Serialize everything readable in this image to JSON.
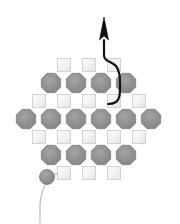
{
  "figure": {
    "width": 180,
    "height": 223,
    "background_color": "#ffffff"
  },
  "colors": {
    "octagon_fill": "#8d8d8d",
    "octagon_fill_light": "#a2a2a2",
    "octagon_stroke": "#7a7a7a",
    "square_fill": "#efefef",
    "square_fill_light": "#fbfbfb",
    "square_stroke": "#cfcfcf",
    "wire_black": "#111111",
    "wire_gray": "#c3c3c3",
    "circle_fill": "#8d8d8d",
    "circle_stroke": "#7a7a7a"
  },
  "geometry": {
    "octagon_radius": 10.5,
    "square_size": 13,
    "column_pitch": 25,
    "row_pitch": 17.5
  },
  "lattice": {
    "rows": [
      {
        "index": 0,
        "type": "square",
        "y": 65,
        "count": 3,
        "items": [
          {
            "name": "site-0-0",
            "x": 64
          },
          {
            "name": "site-0-1",
            "x": 89
          },
          {
            "name": "site-0-2",
            "x": 114
          }
        ]
      },
      {
        "index": 1,
        "type": "octagon",
        "y": 83,
        "count": 4,
        "items": [
          {
            "name": "node-1-0",
            "x": 51
          },
          {
            "name": "node-1-1",
            "x": 76
          },
          {
            "name": "node-1-2",
            "x": 101
          },
          {
            "name": "node-1-3",
            "x": 126
          }
        ]
      },
      {
        "index": 2,
        "type": "square",
        "y": 101,
        "count": 5,
        "items": [
          {
            "name": "site-2-0",
            "x": 39
          },
          {
            "name": "site-2-1",
            "x": 64
          },
          {
            "name": "site-2-2",
            "x": 89
          },
          {
            "name": "site-2-3",
            "x": 114
          },
          {
            "name": "site-2-4",
            "x": 139
          }
        ]
      },
      {
        "index": 3,
        "type": "octagon",
        "y": 119,
        "count": 6,
        "items": [
          {
            "name": "node-3-0",
            "x": 26
          },
          {
            "name": "node-3-1",
            "x": 51
          },
          {
            "name": "node-3-2",
            "x": 76
          },
          {
            "name": "node-3-3",
            "x": 101
          },
          {
            "name": "node-3-4",
            "x": 126
          },
          {
            "name": "node-3-5",
            "x": 151
          }
        ]
      },
      {
        "index": 4,
        "type": "square",
        "y": 137,
        "count": 5,
        "items": [
          {
            "name": "site-4-0",
            "x": 39
          },
          {
            "name": "site-4-1",
            "x": 64
          },
          {
            "name": "site-4-2",
            "x": 89
          },
          {
            "name": "site-4-3",
            "x": 114
          },
          {
            "name": "site-4-4",
            "x": 139
          }
        ]
      },
      {
        "index": 5,
        "type": "octagon",
        "y": 155,
        "count": 4,
        "items": [
          {
            "name": "node-5-0",
            "x": 51
          },
          {
            "name": "node-5-1",
            "x": 76
          },
          {
            "name": "node-5-2",
            "x": 101
          },
          {
            "name": "node-5-3",
            "x": 126
          }
        ]
      },
      {
        "index": 6,
        "type": "square",
        "y": 173,
        "count": 3,
        "items": [
          {
            "name": "site-6-0",
            "x": 64
          },
          {
            "name": "site-6-1",
            "x": 89
          },
          {
            "name": "site-6-2",
            "x": 114
          }
        ]
      }
    ]
  },
  "probe": {
    "arrow": {
      "name": "probe-arrow",
      "tip_x": 104,
      "tip_y": 17,
      "tail_x": 104,
      "tail_y": 43,
      "color": "#111111",
      "points": "104,17 99.5,40 104,36 108.5,40"
    },
    "wire": {
      "name": "probe-wire",
      "color": "#111111",
      "width": 2.2,
      "path": "M 104 40 L 104 55 C 104 62 112 61 116 66 C 120 71 120 78 120 86 C 120 94 120 99 116 102 C 113 104 110 104 108 104"
    }
  },
  "tether": {
    "circle": {
      "name": "tether-node",
      "cx": 47,
      "cy": 177,
      "r": 7.5,
      "fill": "#8d8d8d",
      "stroke": "#7a7a7a"
    },
    "wire": {
      "name": "tether-wire",
      "color": "#c3c3c3",
      "width": 1.4,
      "path": "M 45 184 C 42 192 40 198 40 206 L 40 223"
    },
    "stub": {
      "name": "tether-stub",
      "color": "#c3c3c3",
      "width": 1.4,
      "path": "M 54 175 L 58 173"
    }
  }
}
